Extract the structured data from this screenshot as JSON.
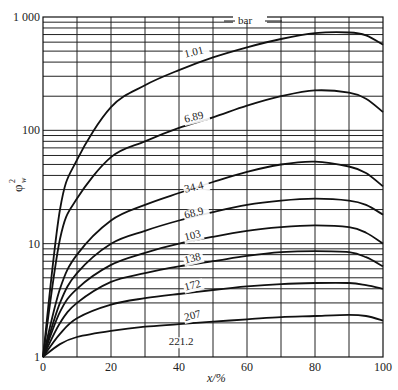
{
  "chart_data": {
    "type": "line",
    "title": "",
    "xlabel": "x/%",
    "ylabel": "φ_w^2",
    "xlim": [
      0,
      100
    ],
    "ylim": [
      1,
      1000
    ],
    "yscale": "log",
    "grid": true,
    "x_ticks": [
      "0",
      "20",
      "40",
      "60",
      "80",
      "100"
    ],
    "y_ticks": [
      "1",
      "10",
      "100",
      "1 000"
    ],
    "legend_title": "bar",
    "x": [
      0,
      5,
      10,
      20,
      30,
      40,
      50,
      60,
      70,
      80,
      90,
      95,
      100
    ],
    "series": [
      {
        "name": "1.01",
        "label_at": [
          42,
          420
        ],
        "values": [
          1,
          20,
          55,
          160,
          250,
          340,
          440,
          540,
          640,
          720,
          730,
          690,
          570
        ]
      },
      {
        "name": "6.89",
        "label_at": [
          42,
          112
        ],
        "values": [
          1,
          11,
          25,
          58,
          80,
          105,
          130,
          165,
          200,
          225,
          215,
          190,
          145
        ]
      },
      {
        "name": "34.4",
        "label_at": [
          42,
          27
        ],
        "values": [
          1,
          4,
          8,
          16,
          22,
          28,
          35,
          43,
          50,
          53,
          48,
          42,
          32
        ]
      },
      {
        "name": "68.9",
        "label_at": [
          42,
          16
        ],
        "values": [
          1,
          3,
          5.5,
          10,
          13,
          16,
          19,
          22,
          24,
          25,
          24,
          22,
          18
        ]
      },
      {
        "name": "103",
        "label_at": [
          42,
          10.2
        ],
        "values": [
          1,
          2.5,
          4,
          6.5,
          8.3,
          10,
          11.5,
          13,
          14,
          14.5,
          14,
          12.5,
          10
        ]
      },
      {
        "name": "138",
        "label_at": [
          42,
          6.4
        ],
        "values": [
          1,
          2.0,
          3,
          4.6,
          5.5,
          6.3,
          7,
          7.8,
          8.4,
          8.6,
          8.4,
          7.6,
          6.3
        ]
      },
      {
        "name": "172",
        "label_at": [
          42,
          3.7
        ],
        "values": [
          1,
          1.6,
          2.2,
          2.9,
          3.3,
          3.6,
          3.9,
          4.2,
          4.4,
          4.5,
          4.5,
          4.3,
          4.0
        ]
      },
      {
        "name": "207",
        "label_at": [
          42,
          2.0
        ],
        "values": [
          1,
          1.3,
          1.5,
          1.7,
          1.85,
          1.95,
          2.05,
          2.15,
          2.25,
          2.3,
          2.35,
          2.3,
          2.1
        ]
      },
      {
        "name": "221.2",
        "label_at": [
          37,
          1.22
        ],
        "values": [
          1,
          1,
          1,
          1,
          1,
          1,
          1,
          1,
          1,
          1,
          1,
          1,
          1
        ]
      }
    ]
  },
  "axes": {
    "xlabel": "x/%",
    "ylabel_main": "φ",
    "ylabel_sub": "w",
    "ylabel_sup": "2",
    "legend_title": "bar"
  }
}
